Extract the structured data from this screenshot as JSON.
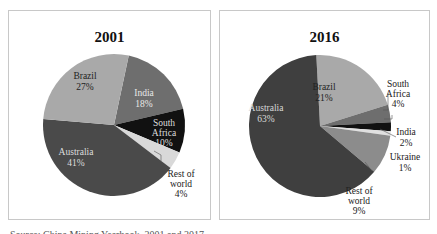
{
  "chart_data": [
    {
      "type": "pie",
      "title": "2001",
      "slices": [
        {
          "label": "India",
          "value": 18,
          "pct_label": "18%",
          "color": "#6e6e6e"
        },
        {
          "label": "South Africa",
          "value": 10,
          "pct_label": "10%",
          "color": "#111111"
        },
        {
          "label": "Rest of world",
          "value": 4,
          "pct_label": "4%",
          "color": "#d9d9d9"
        },
        {
          "label": "Australia",
          "value": 41,
          "pct_label": "41%",
          "color": "#4a4a4a"
        },
        {
          "label": "Brazil",
          "value": 27,
          "pct_label": "27%",
          "color": "#a9a9a9"
        }
      ]
    },
    {
      "type": "pie",
      "title": "2016",
      "slices": [
        {
          "label": "Brazil",
          "value": 21,
          "pct_label": "21%",
          "color": "#a9a9a9"
        },
        {
          "label": "South Africa",
          "value": 4,
          "pct_label": "4%",
          "color": "#6e6e6e"
        },
        {
          "label": "India",
          "value": 2,
          "pct_label": "2%",
          "color": "#111111"
        },
        {
          "label": "Ukraine",
          "value": 1,
          "pct_label": "1%",
          "color": "#e0e0e0"
        },
        {
          "label": "Rest of world",
          "value": 9,
          "pct_label": "9%",
          "color": "#8c8c8c"
        },
        {
          "label": "Australia",
          "value": 63,
          "pct_label": "63%",
          "color": "#3f3f3f"
        }
      ]
    }
  ],
  "left": {
    "title": "2001",
    "labels": {
      "brazil": [
        "Brazil",
        "27%"
      ],
      "india": [
        "India",
        "18%"
      ],
      "south_africa": [
        "South",
        "Africa",
        "10%"
      ],
      "australia": [
        "Australia",
        "41%"
      ],
      "rest": [
        "Rest of",
        "world",
        "4%"
      ]
    }
  },
  "right": {
    "title": "2016",
    "labels": {
      "brazil": [
        "Brazil",
        "21%"
      ],
      "south_africa": [
        "South",
        "Africa",
        "4%"
      ],
      "india": [
        "India",
        "2%"
      ],
      "ukraine": [
        "Ukraine",
        "1%"
      ],
      "rest": [
        "Rest of",
        "world",
        "9%"
      ],
      "australia": [
        "Australia",
        "63%"
      ]
    }
  },
  "caption": "Source: China Mining Yearbook, 2001 and 2017."
}
